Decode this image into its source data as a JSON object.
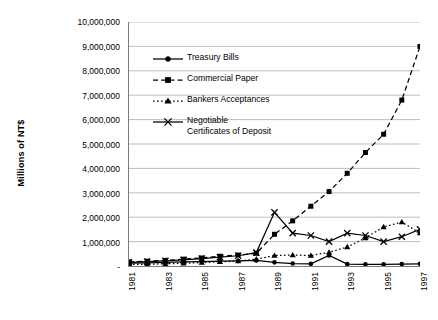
{
  "chart_data": {
    "type": "line",
    "title": "",
    "xlabel": "",
    "ylabel": "Millions of NT$",
    "x": [
      1981,
      1982,
      1983,
      1984,
      1985,
      1986,
      1987,
      1988,
      1989,
      1990,
      1991,
      1992,
      1993,
      1994,
      1995,
      1996,
      1997
    ],
    "xtick_labels": [
      "1981",
      "1983",
      "1985",
      "1987",
      "1989",
      "1991",
      "1993",
      "1995",
      "1997"
    ],
    "xtick_values": [
      1981,
      1983,
      1985,
      1987,
      1989,
      1991,
      1993,
      1995,
      1997
    ],
    "ytick_labels": [
      "10,000,000",
      "9,000,000",
      "8,000,000",
      "7,000,000",
      "6,000,000",
      "5,000,000",
      "4,000,000",
      "3,000,000",
      "2,000,000",
      "1,000,000",
      "-"
    ],
    "ytick_values": [
      10000000,
      9000000,
      8000000,
      7000000,
      6000000,
      5000000,
      4000000,
      3000000,
      2000000,
      1000000,
      0
    ],
    "ylim": [
      0,
      10000000
    ],
    "xlim": [
      1981,
      1997
    ],
    "grid": "horizontal",
    "legend_position": "inside-top-left",
    "series": [
      {
        "name": "Treasury Bills",
        "marker": "circle",
        "line": "solid",
        "values": [
          120000,
          130000,
          150000,
          170000,
          180000,
          200000,
          210000,
          230000,
          150000,
          100000,
          90000,
          430000,
          80000,
          70000,
          70000,
          80000,
          90000
        ]
      },
      {
        "name": "Commercial Paper",
        "marker": "square",
        "line": "dashed",
        "values": [
          170000,
          200000,
          230000,
          280000,
          330000,
          400000,
          450000,
          520000,
          1300000,
          1850000,
          2450000,
          3050000,
          3800000,
          4650000,
          5400000,
          6800000,
          9000000
        ]
      },
      {
        "name": "Bankers Acceptances",
        "marker": "triangle",
        "line": "dotted",
        "values": [
          60000,
          70000,
          90000,
          110000,
          140000,
          170000,
          200000,
          280000,
          430000,
          450000,
          430000,
          560000,
          780000,
          1150000,
          1600000,
          1800000,
          1350000
        ]
      },
      {
        "name": "Negotiable Certificates of Deposit",
        "marker": "cross",
        "line": "solid",
        "values": [
          150000,
          180000,
          210000,
          250000,
          300000,
          360000,
          420000,
          550000,
          2200000,
          1350000,
          1250000,
          1000000,
          1350000,
          1250000,
          1000000,
          1200000,
          1500000
        ]
      }
    ]
  },
  "legend": {
    "items": [
      {
        "label": "Treasury Bills"
      },
      {
        "label": "Commercial Paper"
      },
      {
        "label": "Bankers Acceptances"
      },
      {
        "label": "Negotiable\nCertificates of Deposit"
      }
    ]
  },
  "colors": {
    "series": "#000000",
    "grid": "#b5b5b5",
    "axis": "#7a7a7a",
    "background": "#ffffff"
  }
}
